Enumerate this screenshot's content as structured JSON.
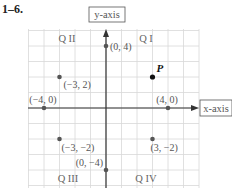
{
  "problem_label": "1–6.",
  "axes": {
    "x_label": "x-axis",
    "y_label": "y-axis"
  },
  "quadrants": [
    {
      "id": "q1",
      "label": "Q I"
    },
    {
      "id": "q2",
      "label": "Q II"
    },
    {
      "id": "q3",
      "label": "Q III"
    },
    {
      "id": "q4",
      "label": "Q IV"
    }
  ],
  "points": [
    {
      "id": "p-0-4",
      "x": 0,
      "y": 4,
      "label": "(0, 4)"
    },
    {
      "id": "p-n3-2",
      "x": -3,
      "y": 2,
      "label": "(−3, 2)"
    },
    {
      "id": "p-n4-0",
      "x": -4,
      "y": 0,
      "label": "(−4, 0)"
    },
    {
      "id": "p-4-0",
      "x": 4,
      "y": 0,
      "label": "(4, 0)"
    },
    {
      "id": "p-n3-n2",
      "x": -3,
      "y": -2,
      "label": "(−3, −2)"
    },
    {
      "id": "p-3-n2",
      "x": 3,
      "y": -2,
      "label": "(3, −2)"
    },
    {
      "id": "p-0-n4",
      "x": 0,
      "y": -4,
      "label": "(0, −4)"
    },
    {
      "id": "p-P",
      "x": 3,
      "y": 2,
      "label": "P",
      "highlight": true
    }
  ],
  "colors": {
    "grid": "#d8d8d8",
    "axis": "#333333",
    "point": "#555555",
    "highlight_point": "#111111",
    "label": "#555555"
  }
}
